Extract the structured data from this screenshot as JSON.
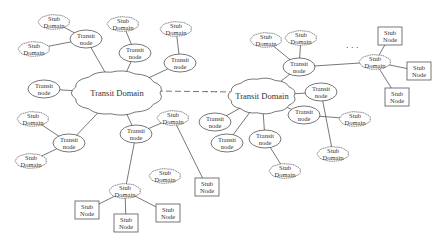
{
  "diagram": {
    "type": "network-topology",
    "labels": {
      "transit_domain": "Transit  Domain",
      "transit_node_line1": "Transit",
      "transit_node_line2": "node",
      "stub_domain_line1": "Stub",
      "stub_domain_line2": "Domain",
      "stub_node_line1": "Stub",
      "stub_node_line2": "Node",
      "ellipsis": ". . ."
    },
    "nodes": [
      {
        "id": "TD1",
        "kind": "transit-domain",
        "label": "Transit Domain",
        "cx": 117,
        "cy": 93,
        "w": 86,
        "h": 42
      },
      {
        "id": "TD2",
        "kind": "transit-domain",
        "label": "Transit Domain",
        "cx": 262,
        "cy": 96,
        "w": 64,
        "h": 34
      },
      {
        "id": "TN1",
        "kind": "transit-node",
        "label": "Transit node",
        "cx": 86,
        "cy": 39
      },
      {
        "id": "TN2",
        "kind": "transit-node",
        "label": "Transit node",
        "cx": 135,
        "cy": 53
      },
      {
        "id": "TN3",
        "kind": "transit-node",
        "label": "Transit node",
        "cx": 180,
        "cy": 63
      },
      {
        "id": "TN4",
        "kind": "transit-node",
        "label": "Transit node",
        "cx": 44,
        "cy": 89
      },
      {
        "id": "TN5",
        "kind": "transit-node",
        "label": "Transit node",
        "cx": 69,
        "cy": 143
      },
      {
        "id": "TN6",
        "kind": "transit-node",
        "label": "Transit node",
        "cx": 136,
        "cy": 134
      },
      {
        "id": "TN7",
        "kind": "transit-node",
        "label": "Transit node",
        "cx": 299,
        "cy": 67
      },
      {
        "id": "TN8",
        "kind": "transit-node",
        "label": "Transit node",
        "cx": 321,
        "cy": 92
      },
      {
        "id": "TN9",
        "kind": "transit-node",
        "label": "Transit node",
        "cx": 215,
        "cy": 122
      },
      {
        "id": "TN10",
        "kind": "transit-node",
        "label": "Transit node",
        "cx": 227,
        "cy": 143
      },
      {
        "id": "TN11",
        "kind": "transit-node",
        "label": "Transit node",
        "cx": 265,
        "cy": 139
      },
      {
        "id": "TN12",
        "kind": "transit-node",
        "label": "Transit node",
        "cx": 304,
        "cy": 115
      },
      {
        "id": "SD1",
        "kind": "stub-domain",
        "label": "Stub Domain",
        "cx": 54,
        "cy": 22
      },
      {
        "id": "SD2",
        "kind": "stub-domain",
        "label": "Stub Domain",
        "cx": 34,
        "cy": 49
      },
      {
        "id": "SD3",
        "kind": "stub-domain",
        "label": "Stub Domain",
        "cx": 123,
        "cy": 24
      },
      {
        "id": "SD4",
        "kind": "stub-domain",
        "label": "Stub Domain",
        "cx": 176,
        "cy": 29
      },
      {
        "id": "SD5",
        "kind": "stub-domain",
        "label": "Stub Domain",
        "cx": 33,
        "cy": 119
      },
      {
        "id": "SD6",
        "kind": "stub-domain",
        "label": "Stub Domain",
        "cx": 31,
        "cy": 161
      },
      {
        "id": "SD7",
        "kind": "stub-domain",
        "label": "Stub Domain",
        "cx": 173,
        "cy": 118
      },
      {
        "id": "SD8",
        "kind": "stub-domain",
        "label": "Stub Domain",
        "cx": 165,
        "cy": 176
      },
      {
        "id": "SD9",
        "kind": "stub-domain",
        "label": "Stub Domain",
        "cx": 125,
        "cy": 191
      },
      {
        "id": "SD10",
        "kind": "stub-domain",
        "label": "Stub Domain",
        "cx": 266,
        "cy": 40
      },
      {
        "id": "SD11",
        "kind": "stub-domain",
        "label": "Stub Domain",
        "cx": 301,
        "cy": 38
      },
      {
        "id": "SD12",
        "kind": "stub-domain",
        "label": "Stub Domain",
        "cx": 375,
        "cy": 62
      },
      {
        "id": "SD13",
        "kind": "stub-domain",
        "label": "Stub Domain",
        "cx": 355,
        "cy": 119
      },
      {
        "id": "SD14",
        "kind": "stub-domain",
        "label": "Stub Domain",
        "cx": 333,
        "cy": 154
      },
      {
        "id": "SD15",
        "kind": "stub-domain",
        "label": "Stub Domain",
        "cx": 285,
        "cy": 171
      },
      {
        "id": "SN1",
        "kind": "stub-node",
        "label": "Stub Node",
        "cx": 87,
        "cy": 210
      },
      {
        "id": "SN2",
        "kind": "stub-node",
        "label": "Stub Node",
        "cx": 126,
        "cy": 223
      },
      {
        "id": "SN3",
        "kind": "stub-node",
        "label": "Stub Node",
        "cx": 168,
        "cy": 213
      },
      {
        "id": "SN4",
        "kind": "stub-node",
        "label": "Stub Node",
        "cx": 207,
        "cy": 187
      },
      {
        "id": "SN5",
        "kind": "stub-node",
        "label": "Stub Node",
        "cx": 390,
        "cy": 36
      },
      {
        "id": "SN6",
        "kind": "stub-node",
        "label": "Stub Node",
        "cx": 419,
        "cy": 71
      },
      {
        "id": "SN7",
        "kind": "stub-node",
        "label": "Stub Node",
        "cx": 397,
        "cy": 97
      }
    ],
    "edges": [
      [
        "SD1",
        "TN1"
      ],
      [
        "SD2",
        "TN1"
      ],
      [
        "TN1",
        "TD1"
      ],
      [
        "SD3",
        "TN2"
      ],
      [
        "TN2",
        "TD1"
      ],
      [
        "SD4",
        "TN3"
      ],
      [
        "TN3",
        "TD1"
      ],
      [
        "TN4",
        "TD1"
      ],
      [
        "SD5",
        "TN5"
      ],
      [
        "SD6",
        "TN5"
      ],
      [
        "TN5",
        "TD1"
      ],
      [
        "TD1",
        "TN6"
      ],
      [
        "TN6",
        "SD7"
      ],
      [
        "TN6",
        "SD9"
      ],
      [
        "SD7",
        "SN4"
      ],
      [
        "SD9",
        "SN1"
      ],
      [
        "SD9",
        "SN2"
      ],
      [
        "SD9",
        "SN3"
      ],
      [
        "TD2",
        "TN7"
      ],
      [
        "SD10",
        "TN7"
      ],
      [
        "SD11",
        "TN7"
      ],
      [
        "TN7",
        "SD12"
      ],
      [
        "SD12",
        "SN5"
      ],
      [
        "SD12",
        "SN6"
      ],
      [
        "SD12",
        "SN7"
      ],
      [
        "TD2",
        "TN12"
      ],
      [
        "TN12",
        "SD13"
      ],
      [
        "TD2",
        "TN8"
      ],
      [
        "TN8",
        "SD14"
      ],
      [
        "TD2",
        "TN9"
      ],
      [
        "TD2",
        "TN10"
      ],
      [
        "TD2",
        "TN11"
      ],
      [
        "TN11",
        "SD15"
      ]
    ],
    "dashed_links": [
      {
        "from": "TD1",
        "to": "TD2",
        "label": ". . ."
      }
    ],
    "ellipsis_marks": [
      {
        "x": 205,
        "y": 92,
        "text": ". . ."
      },
      {
        "x": 346,
        "y": 48,
        "text": ". . ."
      }
    ]
  }
}
